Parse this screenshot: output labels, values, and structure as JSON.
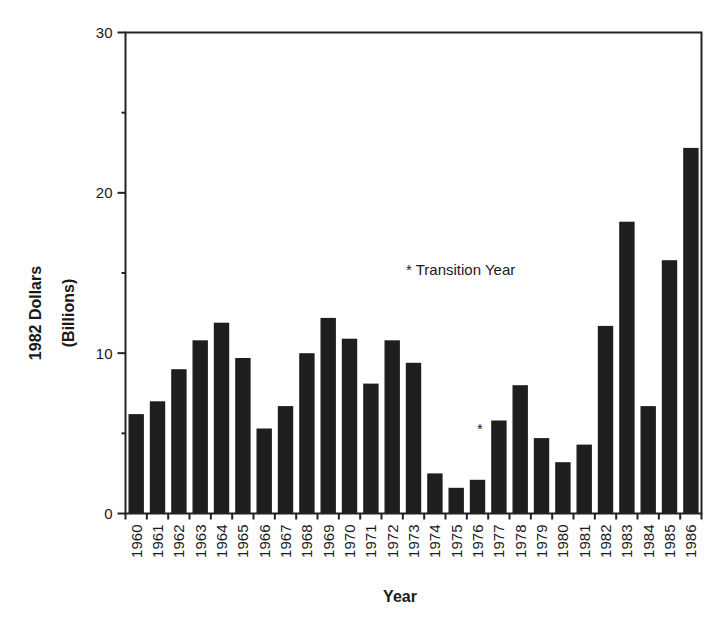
{
  "chart_data": {
    "type": "bar",
    "title": "",
    "xlabel": "Year",
    "ylabel": "1982 Dollars",
    "ylabel_line2": "(Billions)",
    "ylim": [
      0,
      30
    ],
    "yticks": [
      0,
      10,
      20,
      30
    ],
    "y_minor_ticks": [
      5,
      15,
      25
    ],
    "grid": false,
    "legend": null,
    "bar_color": "#1e1e1e",
    "categories": [
      "1960",
      "1961",
      "1962",
      "1963",
      "1964",
      "1965",
      "1966",
      "1967",
      "1968",
      "1969",
      "1970",
      "1971",
      "1972",
      "1973",
      "1974",
      "1975",
      "1976",
      "1977",
      "1978",
      "1979",
      "1980",
      "1981",
      "1982",
      "1983",
      "1984",
      "1985",
      "1986"
    ],
    "values": [
      6.2,
      7.0,
      9.0,
      10.8,
      11.9,
      9.7,
      5.3,
      6.7,
      10.0,
      12.2,
      10.9,
      8.1,
      10.8,
      9.4,
      2.5,
      1.6,
      2.1,
      5.8,
      8.0,
      4.7,
      3.2,
      4.3,
      11.7,
      18.2,
      6.7,
      15.8,
      22.8
    ],
    "annotations": [
      {
        "text": "* Transition Year",
        "position": "plot-center"
      },
      {
        "text": "*",
        "marks_category": "1976"
      }
    ]
  }
}
